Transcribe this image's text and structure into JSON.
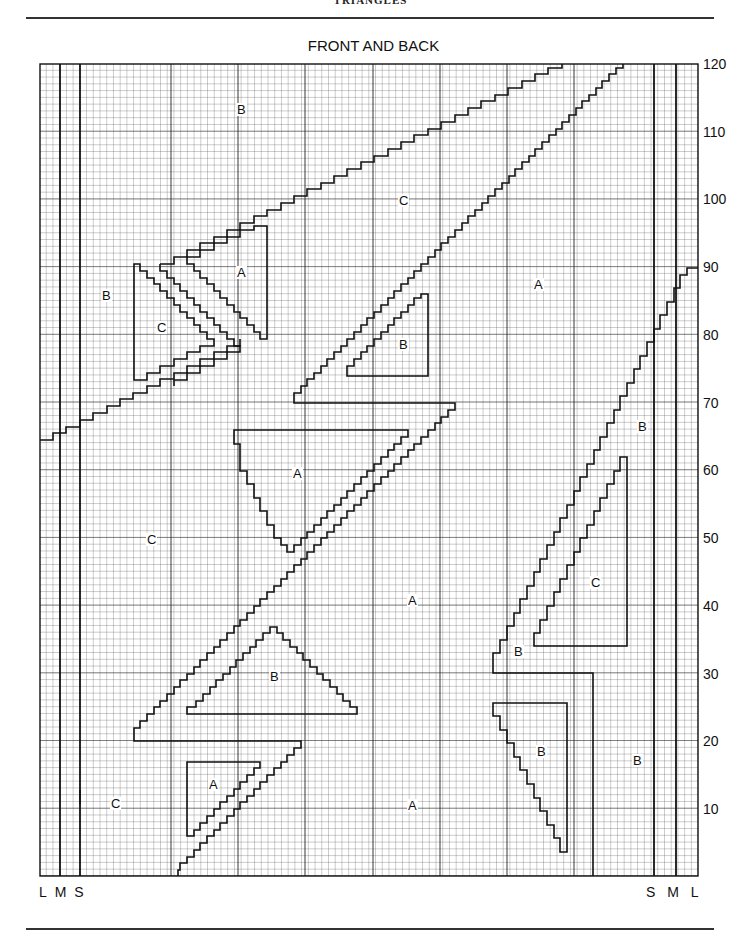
{
  "page_header": "TRIANGLES",
  "chart_title": "FRONT AND BACK",
  "size_markers": {
    "left": [
      "L",
      "M",
      "S"
    ],
    "right": [
      "S",
      "M",
      "L"
    ]
  },
  "y_axis_labels": [
    "120",
    "110",
    "100",
    "90",
    "80",
    "70",
    "60",
    "50",
    "40",
    "30",
    "20",
    "10"
  ],
  "zone_labels": [
    {
      "text": "B",
      "x": 236,
      "y": 103
    },
    {
      "text": "C",
      "x": 398,
      "y": 194
    },
    {
      "text": "B",
      "x": 101,
      "y": 289
    },
    {
      "text": "A",
      "x": 236,
      "y": 266
    },
    {
      "text": "C",
      "x": 156,
      "y": 321
    },
    {
      "text": "A",
      "x": 533,
      "y": 278
    },
    {
      "text": "B",
      "x": 398,
      "y": 338
    },
    {
      "text": "B",
      "x": 637,
      "y": 420
    },
    {
      "text": "A",
      "x": 292,
      "y": 467
    },
    {
      "text": "C",
      "x": 146,
      "y": 533
    },
    {
      "text": "C",
      "x": 590,
      "y": 576
    },
    {
      "text": "A",
      "x": 407,
      "y": 594
    },
    {
      "text": "B",
      "x": 513,
      "y": 645
    },
    {
      "text": "B",
      "x": 269,
      "y": 670
    },
    {
      "text": "B",
      "x": 536,
      "y": 745
    },
    {
      "text": "B",
      "x": 632,
      "y": 754
    },
    {
      "text": "A",
      "x": 208,
      "y": 778
    },
    {
      "text": "C",
      "x": 110,
      "y": 797
    },
    {
      "text": "A",
      "x": 407,
      "y": 799
    }
  ],
  "chart_data": {
    "type": "knitting-chart-grid",
    "title": "FRONT AND BACK",
    "rows": 120,
    "row_label_step": 10,
    "columns": 98,
    "colour_areas": [
      "A",
      "B",
      "C"
    ],
    "size_lines": [
      "L",
      "M",
      "S"
    ]
  }
}
